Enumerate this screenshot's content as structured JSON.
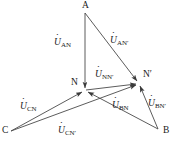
{
  "figure": {
    "type": "phasor-diagram",
    "title": "",
    "background": "#ffffff",
    "stroke_color": "#4a4a4a",
    "text_color": "#1a1a1a",
    "width": 183,
    "height": 154
  },
  "vertices": [
    {
      "id": "A",
      "label": "A",
      "x": 85,
      "y": 13,
      "label_x": 82,
      "label_y": 2
    },
    {
      "id": "B",
      "label": "B",
      "x": 158,
      "y": 129,
      "label_x": 162,
      "label_y": 128
    },
    {
      "id": "C",
      "label": "C",
      "x": 11,
      "y": 131,
      "label_x": 2,
      "label_y": 126
    },
    {
      "id": "N",
      "label": "N",
      "x": 85,
      "y": 90,
      "label_x": 71,
      "label_y": 79
    },
    {
      "id": "N'",
      "label": "N′",
      "x": 139,
      "y": 83,
      "label_x": 143,
      "label_y": 71
    }
  ],
  "phasors": [
    {
      "id": "U_AN",
      "from": "A",
      "to": "N",
      "symbol": "U",
      "subscript": "AN",
      "label_x": 56,
      "label_y": 40
    },
    {
      "id": "U_AN'",
      "from": "A",
      "to": "N'",
      "symbol": "U",
      "subscript": "AN′",
      "label_x": 112,
      "label_y": 38
    },
    {
      "id": "U_NN'",
      "from": "N",
      "to": "N'",
      "symbol": "U",
      "subscript": "NN′",
      "label_x": 96,
      "label_y": 72
    },
    {
      "id": "U_BN",
      "from": "B",
      "to": "N",
      "symbol": "U",
      "subscript": "BN",
      "label_x": 114,
      "label_y": 103
    },
    {
      "id": "U_BN'",
      "from": "B",
      "to": "N'",
      "symbol": "U",
      "subscript": "BN′",
      "label_x": 149,
      "label_y": 101
    },
    {
      "id": "U_CN",
      "from": "C",
      "to": "N",
      "symbol": "U",
      "subscript": "CN",
      "label_x": 22,
      "label_y": 104
    },
    {
      "id": "U_CN'",
      "from": "C",
      "to": "N'",
      "symbol": "U",
      "subscript": "CN′",
      "label_x": 60,
      "label_y": 128
    }
  ]
}
